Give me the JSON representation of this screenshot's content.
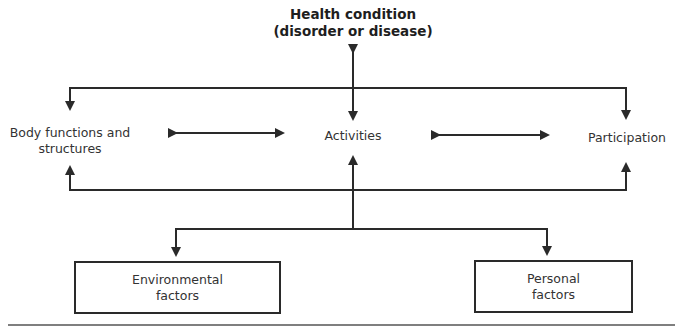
{
  "diagram": {
    "health_condition": {
      "line1": "Health condition",
      "line2": "(disorder or disease)"
    },
    "components": {
      "body": {
        "line1": "Body functions and",
        "line2": "structures"
      },
      "activities": {
        "label": "Activities"
      },
      "participation": {
        "label": "Participation"
      }
    },
    "contextual_factors": {
      "environmental": {
        "line1": "Environmental",
        "line2": "factors"
      },
      "personal": {
        "line1": "Personal",
        "line2": "factors"
      }
    },
    "connections": [
      {
        "from": "Health condition",
        "to": "Activities",
        "type": "bidirectional"
      },
      {
        "from": "Health condition",
        "to": "Body functions and structures",
        "type": "directed"
      },
      {
        "from": "Health condition",
        "to": "Participation",
        "type": "directed"
      },
      {
        "from": "Body functions and structures",
        "to": "Activities",
        "type": "bidirectional"
      },
      {
        "from": "Activities",
        "to": "Participation",
        "type": "bidirectional"
      },
      {
        "from": "Environmental factors",
        "to": "Body functions and structures",
        "type": "directed"
      },
      {
        "from": "Environmental factors",
        "to": "Activities",
        "type": "directed"
      },
      {
        "from": "Environmental factors",
        "to": "Participation",
        "type": "directed"
      },
      {
        "from": "Activities",
        "to": "Environmental factors",
        "type": "directed"
      },
      {
        "from": "Activities",
        "to": "Personal factors",
        "type": "directed"
      }
    ],
    "colors": {
      "line": "#2a2a2a",
      "text": "#333333",
      "background": "#ffffff"
    }
  }
}
